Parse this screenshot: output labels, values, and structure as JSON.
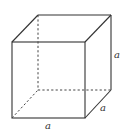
{
  "diagram": {
    "type": "cube",
    "labels": {
      "height": "a",
      "depth": "a",
      "width": "a"
    },
    "colors": {
      "stroke": "#333333",
      "background": "#ffffff"
    }
  }
}
